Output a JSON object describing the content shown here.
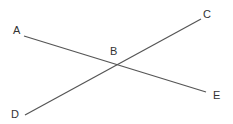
{
  "diagram": {
    "type": "intersecting-lines",
    "line_color": "#555555",
    "label_color": "#333333",
    "points": [
      {
        "id": "A",
        "label": "A",
        "x": 24,
        "y": 36,
        "lx": 13,
        "ly": 25
      },
      {
        "id": "B",
        "label": "B",
        "x": 116,
        "y": 64,
        "lx": 110,
        "ly": 46
      },
      {
        "id": "C",
        "label": "C",
        "x": 201,
        "y": 19,
        "lx": 203,
        "ly": 9
      },
      {
        "id": "D",
        "label": "D",
        "x": 25,
        "y": 115,
        "lx": 11,
        "ly": 109
      },
      {
        "id": "E",
        "label": "E",
        "x": 206,
        "y": 92,
        "lx": 213,
        "ly": 90
      }
    ],
    "segments": [
      {
        "from": "A",
        "to": "E"
      },
      {
        "from": "D",
        "to": "C"
      }
    ]
  }
}
